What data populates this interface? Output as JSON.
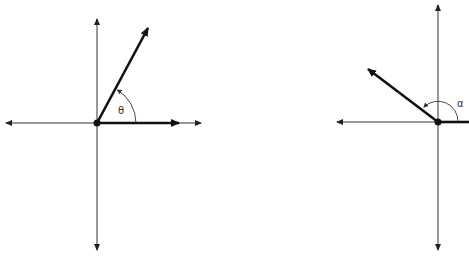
{
  "diagrams": [
    {
      "name": "angle-theta",
      "angle_label": "θ",
      "angle_description": "acute angle in standard position (first quadrant)"
    },
    {
      "name": "angle-alpha",
      "angle_label": "α",
      "angle_description": "obtuse angle in standard position (second quadrant)"
    }
  ],
  "colors": {
    "stroke": "#1a1a1a",
    "axis": "#333333"
  }
}
